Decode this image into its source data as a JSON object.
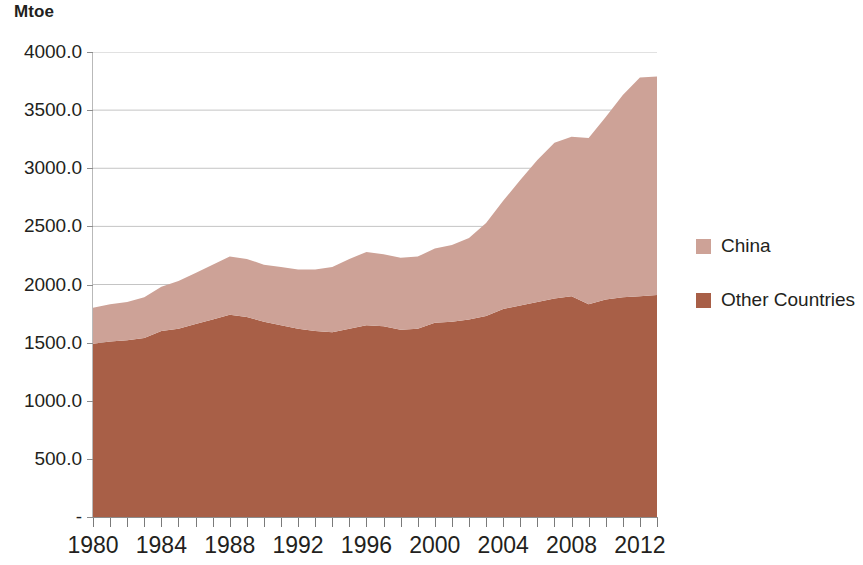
{
  "axis_unit_title": "Mtoe",
  "legend": {
    "entries": [
      {
        "label": "China",
        "color": "#cda297"
      },
      {
        "label": "Other Countries",
        "color": "#a85f47"
      }
    ]
  },
  "chart_data": {
    "type": "area",
    "stacked": true,
    "title": "",
    "subtitle": "",
    "xlabel": "",
    "ylabel": "Mtoe",
    "ylim": [
      0,
      4000
    ],
    "xlim": [
      1980,
      2013
    ],
    "grid": true,
    "grid_axis": "y",
    "legend_position": "right",
    "y_tick_values": [
      0,
      500,
      1000,
      1500,
      2000,
      2500,
      3000,
      3500,
      4000
    ],
    "y_tick_labels": [
      "-",
      "500.0",
      "1000.0",
      "1500.0",
      "2000.0",
      "2500.0",
      "3000.0",
      "3500.0",
      "4000.0"
    ],
    "x_tick_labels": [
      "1980",
      "1984",
      "1988",
      "1992",
      "1996",
      "2000",
      "2004",
      "2008",
      "2012"
    ],
    "x_tick_label_values": [
      1980,
      1984,
      1988,
      1992,
      1996,
      2000,
      2004,
      2008,
      2012
    ],
    "x_minor_ticks_every": 1,
    "x": [
      1980,
      1981,
      1982,
      1983,
      1984,
      1985,
      1986,
      1987,
      1988,
      1989,
      1990,
      1991,
      1992,
      1993,
      1994,
      1995,
      1996,
      1997,
      1998,
      1999,
      2000,
      2001,
      2002,
      2003,
      2004,
      2005,
      2006,
      2007,
      2008,
      2009,
      2010,
      2011,
      2012,
      2013
    ],
    "series": [
      {
        "name": "Other Countries",
        "color": "#a85f47",
        "values": [
          1490,
          1510,
          1520,
          1540,
          1600,
          1620,
          1660,
          1700,
          1740,
          1720,
          1680,
          1650,
          1620,
          1600,
          1590,
          1620,
          1650,
          1640,
          1610,
          1620,
          1670,
          1680,
          1700,
          1730,
          1790,
          1820,
          1850,
          1880,
          1900,
          1830,
          1870,
          1890,
          1900,
          1910
        ]
      },
      {
        "name": "China",
        "color": "#cda297",
        "values": [
          310,
          320,
          330,
          350,
          380,
          410,
          440,
          470,
          500,
          500,
          490,
          500,
          510,
          530,
          560,
          600,
          630,
          620,
          620,
          620,
          640,
          660,
          700,
          800,
          930,
          1080,
          1220,
          1340,
          1370,
          1430,
          1570,
          1740,
          1880,
          1880
        ]
      }
    ],
    "totals": [
      1800,
      1830,
      1850,
      1890,
      1980,
      2030,
      2100,
      2170,
      2240,
      2220,
      2170,
      2150,
      2130,
      2130,
      2150,
      2220,
      2280,
      2260,
      2230,
      2240,
      2310,
      2340,
      2400,
      2530,
      2720,
      2900,
      3070,
      3220,
      3270,
      3260,
      3440,
      3630,
      3780,
      3790
    ]
  }
}
